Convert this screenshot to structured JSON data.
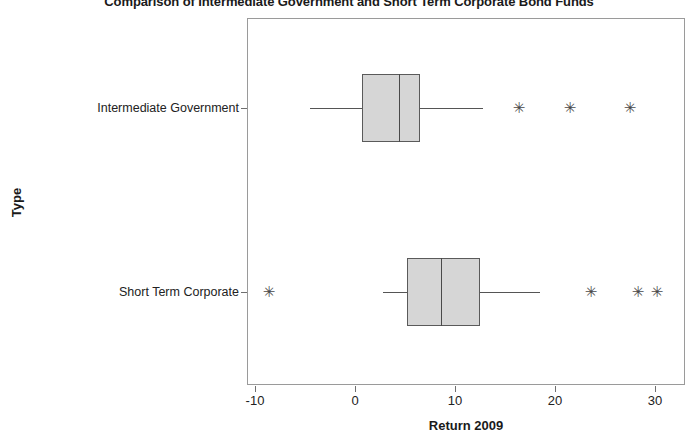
{
  "chart_data": {
    "type": "box",
    "title": "Comparison of Intermediate Government and Short Term Corporate Bond Funds",
    "xlabel": "Return 2009",
    "ylabel": "Type",
    "xlim": [
      -14.8,
      33.0
    ],
    "xticks": [
      -10,
      0,
      10,
      20,
      30
    ],
    "xtick_labels": [
      "-10",
      "0",
      "10",
      "20",
      "30"
    ],
    "grid": false,
    "legend": "none",
    "orientation": "horizontal",
    "categories": [
      "Intermediate Government",
      "Short Term Corporate"
    ],
    "boxes": [
      {
        "category": "Intermediate Government",
        "whisker_low": -4.5,
        "q1": 0.7,
        "median": 4.4,
        "q3": 6.5,
        "whisker_high": 12.8,
        "outliers": [
          16.4,
          21.5,
          27.5
        ]
      },
      {
        "category": "Short Term Corporate",
        "whisker_low": 2.8,
        "q1": 5.2,
        "median": 8.6,
        "q3": 12.5,
        "whisker_high": 18.5,
        "outliers": [
          -8.6,
          23.6,
          28.3,
          30.2
        ]
      }
    ],
    "colors": {
      "box_fill": "#d6d6d6",
      "box_edge": "#5a5a5a",
      "median": "#4a4a4a",
      "whisker": "#555555",
      "outlier": "#4a4a4a",
      "frame": "#9a9a9a"
    },
    "outlier_marker": "✳"
  }
}
